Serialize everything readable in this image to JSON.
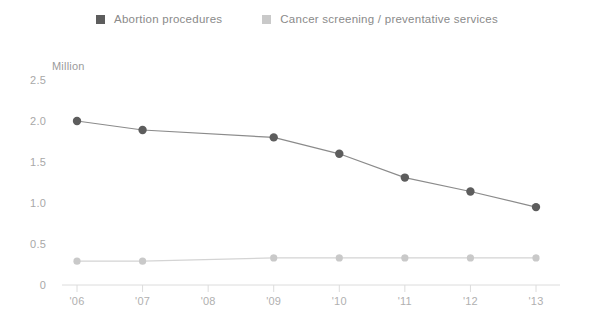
{
  "legend": {
    "items": [
      {
        "label": "Abortion procedures",
        "color": "#5d5d5d",
        "swatch_name": "legend-swatch-abortion"
      },
      {
        "label": "Cancer screening / preventative services",
        "color": "#c9c9c9",
        "swatch_name": "legend-swatch-cancer"
      }
    ]
  },
  "chart_data": {
    "type": "line",
    "title": "",
    "subtitle": "",
    "xlabel": "",
    "ylabel": "Million",
    "unit_label": "Million",
    "x": [
      "'06",
      "'07",
      "'08",
      "'09",
      "'10",
      "'11",
      "'12",
      "'13"
    ],
    "categories": [
      "'06",
      "'07",
      "'08",
      "'09",
      "'10",
      "'11",
      "'12",
      "'13"
    ],
    "ylim": [
      0,
      2.5
    ],
    "yticks": [
      "0",
      "0.5",
      "1.0",
      "1.5",
      "2.0",
      "2.5"
    ],
    "ytick_values": [
      0,
      0.5,
      1.0,
      1.5,
      2.0,
      2.5
    ],
    "grid": false,
    "legend_position": "top-center",
    "series": [
      {
        "name": "Abortion procedures",
        "color": "#5d5d5d",
        "line_color": "#8b8b8b",
        "values": [
          2.0,
          1.89,
          null,
          1.8,
          1.6,
          1.31,
          1.14,
          0.95
        ],
        "markers": [
          true,
          true,
          false,
          true,
          true,
          true,
          true,
          true
        ]
      },
      {
        "name": "Cancer screening / preventative services",
        "color": "#c9c9c9",
        "line_color": "#d4d4d4",
        "values": [
          0.29,
          0.29,
          null,
          0.33,
          0.33,
          0.33,
          0.33,
          0.33
        ],
        "markers": [
          true,
          true,
          false,
          true,
          true,
          true,
          true,
          true
        ]
      }
    ]
  },
  "axis": {
    "line_color": "#dcdcdc",
    "tick_color": "#dcdcdc"
  }
}
